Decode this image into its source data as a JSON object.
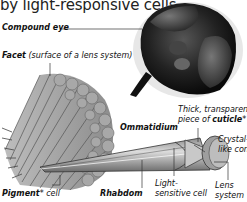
{
  "intro_text": "by light-responsive cells.",
  "labels": {
    "compound_eye": "Compound eye",
    "facet_bold": "Facet",
    "facet_note": " (surface of a lens system)",
    "ommatidium": "Ommatidium",
    "cuticle_line1": "Thick, transparent",
    "cuticle_line2_pre": "piece of ",
    "cuticle_line2_bold": "cuticle",
    "cuticle_star": "*",
    "crystal_line1": "Crystal-",
    "crystal_line2": "like cone",
    "light_line1": "Light-",
    "light_line2": "sensitive cell",
    "lens_line1": "Lens",
    "lens_line2": "system",
    "pigment_bold": "Pigment",
    "pigment_star": "*",
    "pigment_rest": " cell",
    "rhabdom": "Rhabdom"
  },
  "colors": {
    "text": "#111111",
    "line": "#333333",
    "tissue": "#9a9a9a",
    "tissue_dark": "#555555",
    "background": "#ffffff"
  }
}
